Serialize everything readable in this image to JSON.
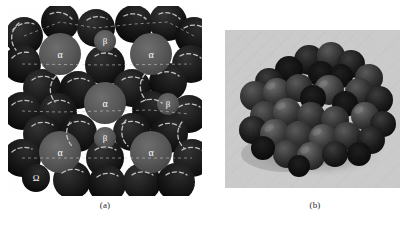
{
  "figure": {
    "background_color": "#ffffff",
    "panels": [
      {
        "id": "a",
        "caption": "(a)",
        "kind": "schematic-sphere-packing-diagram",
        "description": "Two-dimensional schematic of a close-packed sphere array with labelled interstitial and substitutional sites",
        "colors": {
          "large_sphere_dark": "#1d1d1d",
          "large_sphere_dark_shade": "#0b0b0b",
          "labelled_sphere_gray": "#575757",
          "labelled_sphere_gray_shade": "#3f3f3f",
          "highlight_arc": "#d8d8d8",
          "label_text": "#ffffff",
          "background": "#ffffff"
        },
        "site_labels": [
          "α",
          "β",
          "Ω"
        ],
        "labelled_sites": [
          {
            "label": "α",
            "cx": 52,
            "cy": 48,
            "r": 21,
            "kind": "large-gray"
          },
          {
            "label": "α",
            "cx": 143,
            "cy": 48,
            "r": 21,
            "kind": "large-gray"
          },
          {
            "label": "α",
            "cx": 97,
            "cy": 97,
            "r": 21,
            "kind": "large-gray"
          },
          {
            "label": "α",
            "cx": 52,
            "cy": 146,
            "r": 21,
            "kind": "large-gray"
          },
          {
            "label": "α",
            "cx": 143,
            "cy": 146,
            "r": 21,
            "kind": "large-gray"
          },
          {
            "label": "β",
            "cx": 97,
            "cy": 35,
            "r": 11,
            "kind": "small-gray"
          },
          {
            "label": "β",
            "cx": 160,
            "cy": 98,
            "r": 11,
            "kind": "small-gray"
          },
          {
            "label": "β",
            "cx": 97,
            "cy": 132,
            "r": 11,
            "kind": "small-gray"
          },
          {
            "label": "Ω",
            "cx": 28,
            "cy": 172,
            "r": 14,
            "kind": "dark"
          }
        ],
        "unlabelled_sphere_count": 38
      },
      {
        "id": "b",
        "caption": "(b)",
        "kind": "photograph",
        "description": "Photograph of a physical ball model of the packed cluster resting on a light textured surface",
        "colors": {
          "surface_background": "#c9c9c9",
          "surface_shadow": "#9a9a9a",
          "ball_light": "#4a4a4a",
          "ball_mid": "#2e2e2e",
          "ball_dark": "#141414",
          "ball_highlight": "#6a6a6a"
        },
        "ball_count": 46
      }
    ]
  }
}
